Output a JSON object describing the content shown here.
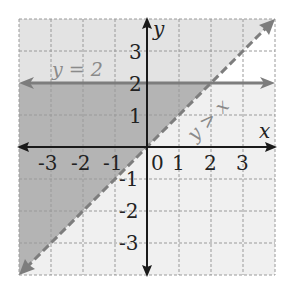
{
  "graph": {
    "x_axis_label": "x",
    "y_axis_label": "y",
    "x_range": [
      -4,
      4
    ],
    "y_range": [
      -4,
      4
    ],
    "x_tick_labels": [
      "-3",
      "-2",
      "-1",
      "0",
      "1",
      "2",
      "3"
    ],
    "y_tick_labels": [
      "3",
      "2",
      "1",
      "-1",
      "-2",
      "-3"
    ],
    "lines": [
      {
        "label": "y = 2",
        "equation": "y = 2",
        "style": "solid"
      },
      {
        "label": "y > x",
        "equation": "y = x",
        "style": "dashed"
      }
    ],
    "colors": {
      "region_above_both": "#e3e3e3",
      "region_overlap": "#b4b4b4",
      "region_below_diagonal": "#f0f0f0",
      "region_white": "#ffffff",
      "line_color": "#7d7d7d",
      "axis_color": "#1a1a1a",
      "grid_color": "#9a9a9a"
    }
  }
}
